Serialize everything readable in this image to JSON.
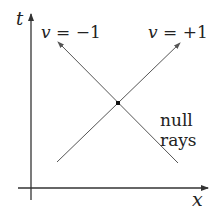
{
  "diagram": {
    "axes": {
      "vertical_label": "t",
      "horizontal_label": "x"
    },
    "rays": [
      {
        "label_var": "v",
        "label_rest": " = −1",
        "direction": "up-left"
      },
      {
        "label_var": "v",
        "label_rest": " = +1",
        "direction": "up-right"
      }
    ],
    "annotation": {
      "line1": "null",
      "line2": "rays"
    },
    "colors": {
      "axis": "#333333",
      "ray": "#555555",
      "dot": "#111111"
    }
  }
}
